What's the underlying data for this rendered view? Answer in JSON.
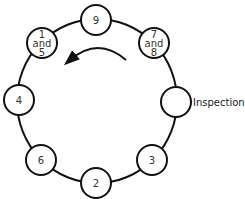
{
  "diagram": {
    "type": "cycle",
    "ring": {
      "cx": 97,
      "cy": 101,
      "rx": 80,
      "ry": 82,
      "stroke": "#111111"
    },
    "direction": "counter-clockwise",
    "nodes": [
      {
        "id": "n9",
        "lines": [
          "9"
        ],
        "x": 96,
        "y": 20
      },
      {
        "id": "n78",
        "lines": [
          "7",
          "and",
          "8"
        ],
        "x": 154,
        "y": 43
      },
      {
        "id": "ninsp",
        "lines": [
          ""
        ],
        "x": 176,
        "y": 102,
        "side_label": "Inspection"
      },
      {
        "id": "n3",
        "lines": [
          "3"
        ],
        "x": 152,
        "y": 160
      },
      {
        "id": "n2",
        "lines": [
          "2"
        ],
        "x": 96,
        "y": 183
      },
      {
        "id": "n6",
        "lines": [
          "6"
        ],
        "x": 41,
        "y": 160
      },
      {
        "id": "n4",
        "lines": [
          "4"
        ],
        "x": 19,
        "y": 100
      },
      {
        "id": "n15",
        "lines": [
          "1",
          "and",
          "5"
        ],
        "x": 42,
        "y": 43
      }
    ],
    "node_radius": 15
  }
}
